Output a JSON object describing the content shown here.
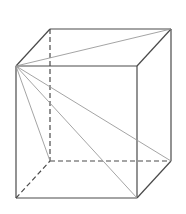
{
  "diagram": {
    "type": "cube-wireframe",
    "vertices": {
      "front_top_left": [
        16,
        66
      ],
      "front_top_right": [
        137,
        66
      ],
      "front_bottom_left": [
        16,
        198
      ],
      "front_bottom_right": [
        137,
        198
      ],
      "back_top_left": [
        50,
        29
      ],
      "back_top_right": [
        171,
        29
      ],
      "back_bottom_left": [
        50,
        161
      ],
      "back_bottom_right": [
        171,
        161
      ]
    },
    "colors": {
      "edge": "#4a4a4a",
      "diagonal": "#9a9a9a",
      "background": "#ffffff"
    }
  }
}
